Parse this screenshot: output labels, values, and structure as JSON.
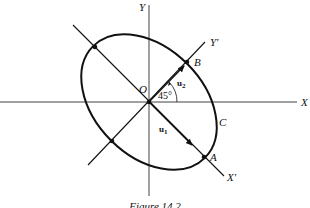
{
  "figure": {
    "caption": "Figure 14.2",
    "labels": {
      "x_axis": "X",
      "y_axis": "Y",
      "x_prime_axis": "X'",
      "y_prime_axis": "Y'",
      "origin": "O",
      "point_a": "A",
      "point_b": "B",
      "curve": "C",
      "vector_u1": "u",
      "vector_u1_sub": "1",
      "vector_u2": "u",
      "vector_u2_sub": "2",
      "angle": "45°"
    },
    "rotation_angle_deg": 45,
    "line_color": "#111111"
  }
}
